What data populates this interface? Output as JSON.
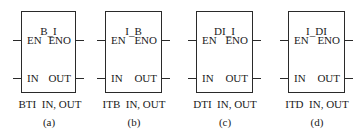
{
  "figure": {
    "blocks": [
      {
        "id": "a",
        "title": "B_I",
        "inputs": [
          "EN",
          "IN"
        ],
        "outputs": [
          "ENO",
          "OUT"
        ],
        "mnemonic": "BTI",
        "operands": "IN, OUT",
        "label": "(a)"
      },
      {
        "id": "b",
        "title": "I_B",
        "inputs": [
          "EN",
          "IN"
        ],
        "outputs": [
          "ENO",
          "OUT"
        ],
        "mnemonic": "ITB",
        "operands": "IN, OUT",
        "label": "(b)"
      },
      {
        "id": "c",
        "title": "DI_I",
        "inputs": [
          "EN",
          "IN"
        ],
        "outputs": [
          "ENO",
          "OUT"
        ],
        "mnemonic": "DTI",
        "operands": "IN, OUT",
        "label": "(c)"
      },
      {
        "id": "d",
        "title": "I_DI",
        "inputs": [
          "EN",
          "IN"
        ],
        "outputs": [
          "ENO",
          "OUT"
        ],
        "mnemonic": "ITD",
        "operands": "IN, OUT",
        "label": "(d)"
      }
    ]
  }
}
